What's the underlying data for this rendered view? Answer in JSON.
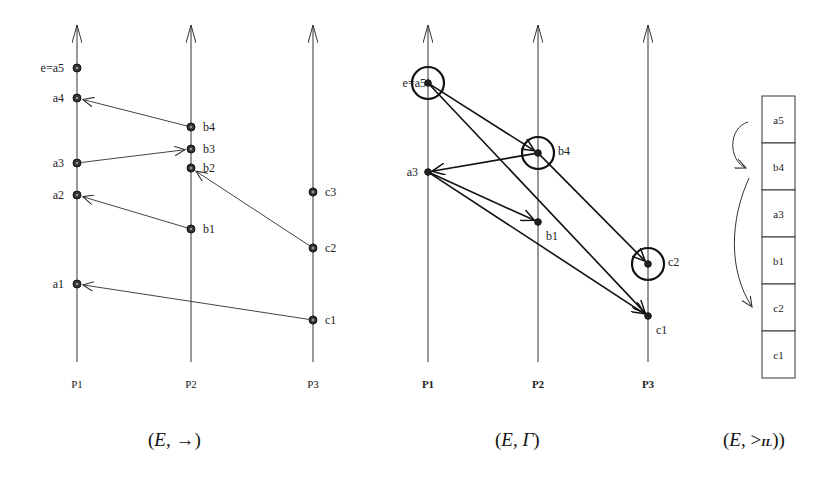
{
  "diagram1": {
    "caption": "(E, →)",
    "caption_parts": [
      "(",
      "E",
      ", →)"
    ],
    "processes": [
      {
        "label": "P1",
        "x": 77
      },
      {
        "label": "P2",
        "x": 191
      },
      {
        "label": "P3",
        "x": 313
      }
    ],
    "events": [
      {
        "id": "a5",
        "label": "e=a5",
        "proc": 0,
        "y": 68
      },
      {
        "id": "a4",
        "label": "a4",
        "proc": 0,
        "y": 98
      },
      {
        "id": "a3",
        "label": "a3",
        "proc": 0,
        "y": 163
      },
      {
        "id": "a2",
        "label": "a2",
        "proc": 0,
        "y": 195
      },
      {
        "id": "a1",
        "label": "a1",
        "proc": 0,
        "y": 284
      },
      {
        "id": "b4",
        "label": "b4",
        "proc": 1,
        "y": 127
      },
      {
        "id": "b3",
        "label": "b3",
        "proc": 1,
        "y": 149
      },
      {
        "id": "b2",
        "label": "b2",
        "proc": 1,
        "y": 168
      },
      {
        "id": "b1",
        "label": "b1",
        "proc": 1,
        "y": 229
      },
      {
        "id": "c3",
        "label": "c3",
        "proc": 2,
        "y": 192
      },
      {
        "id": "c2",
        "label": "c2",
        "proc": 2,
        "y": 248
      },
      {
        "id": "c1",
        "label": "c1",
        "proc": 2,
        "y": 320
      }
    ],
    "messages": [
      {
        "from": "b4",
        "to": "a4"
      },
      {
        "from": "a3",
        "to": "b3"
      },
      {
        "from": "b1",
        "to": "a2"
      },
      {
        "from": "c2",
        "to": "b2"
      },
      {
        "from": "c1",
        "to": "a1"
      }
    ]
  },
  "diagram2": {
    "caption": "(E, Γ)",
    "caption_parts": [
      "(",
      "E",
      ", ",
      "Γ",
      ")"
    ],
    "processes": [
      {
        "label": "P1",
        "x": 428
      },
      {
        "label": "P2",
        "x": 538
      },
      {
        "label": "P3",
        "x": 648
      }
    ],
    "events": [
      {
        "id": "a5",
        "label": "e=a5",
        "proc": 0,
        "y": 83,
        "circled": true
      },
      {
        "id": "b4",
        "label": "b4",
        "proc": 1,
        "y": 153,
        "circled": true
      },
      {
        "id": "a3",
        "label": "a3",
        "proc": 0,
        "y": 172,
        "circled": false
      },
      {
        "id": "b1",
        "label": "b1",
        "proc": 1,
        "y": 222,
        "circled": false
      },
      {
        "id": "c2",
        "label": "c2",
        "proc": 2,
        "y": 264,
        "circled": true
      },
      {
        "id": "c1",
        "label": "c1",
        "proc": 2,
        "y": 316,
        "circled": false
      }
    ],
    "edges": [
      {
        "from": "a5",
        "to": "b4"
      },
      {
        "from": "a5",
        "to": "c1"
      },
      {
        "from": "b4",
        "to": "a3"
      },
      {
        "from": "b4",
        "to": "c2"
      },
      {
        "from": "a3",
        "to": "b1"
      },
      {
        "from": "a3",
        "to": "c1"
      }
    ]
  },
  "diagram3": {
    "caption": "(E, >L)",
    "caption_parts": [
      "(",
      "E",
      ", >",
      "IL",
      ")"
    ],
    "stack": [
      "a5",
      "b4",
      "a3",
      "b1",
      "c2",
      "c1"
    ]
  }
}
